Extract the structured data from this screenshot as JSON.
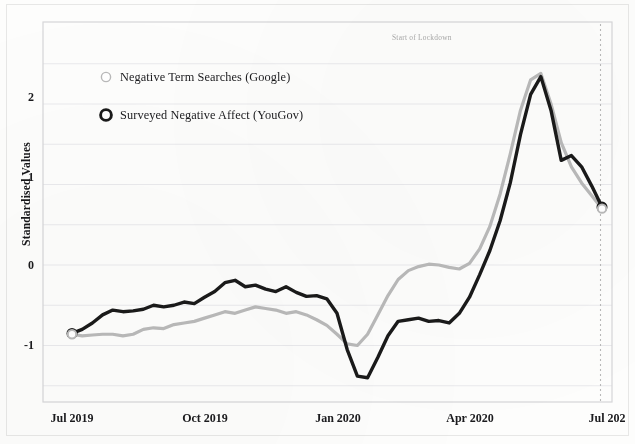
{
  "chart_data": {
    "type": "line",
    "title": "",
    "xlabel": "",
    "ylabel": "Standardised Values",
    "ylim": [
      -1.75,
      2.75
    ],
    "yticks": [
      2,
      1,
      0,
      -1
    ],
    "ytick_labels": [
      "2",
      "1",
      "0",
      "-1"
    ],
    "gridlines_y": [
      2.5,
      2,
      1.5,
      1,
      0.5,
      0,
      -0.5,
      -1,
      -1.5
    ],
    "grid": true,
    "xticks": [
      "Jul 2019",
      "Oct 2019",
      "Jan 2020",
      "Apr 2020",
      "Jul 202"
    ],
    "xtick_positions": [
      0,
      13,
      26,
      39,
      52
    ],
    "x_unit": "weeks from Jul 2019",
    "x_range": [
      0,
      52
    ],
    "legend_position": "upper-left inside plot",
    "annotations": [
      {
        "text": "Start of Lockdown",
        "x": 51.5,
        "type": "vertical-dashed-line",
        "line_x": 52.0,
        "color": "#b9b9b9"
      }
    ],
    "series": [
      {
        "name": "Negative Term Searches (Google)",
        "color": "#b9b9b9",
        "linewidth": 3.2,
        "marker": "open-circle",
        "marker_edge": "#b9b9b9",
        "x": [
          0,
          1,
          2,
          3,
          4,
          5,
          6,
          7,
          8,
          9,
          10,
          11,
          12,
          13,
          14,
          15,
          16,
          17,
          18,
          19,
          20,
          21,
          22,
          23,
          24,
          25,
          26,
          27,
          28,
          29,
          30,
          31,
          32,
          33,
          34,
          35,
          36,
          37,
          38,
          39,
          40,
          41,
          42,
          43,
          44,
          45,
          46,
          47,
          48,
          49,
          50,
          51,
          52
        ],
        "values": [
          -0.86,
          -0.88,
          -0.87,
          -0.86,
          -0.86,
          -0.88,
          -0.86,
          -0.8,
          -0.78,
          -0.79,
          -0.74,
          -0.72,
          -0.7,
          -0.66,
          -0.62,
          -0.58,
          -0.6,
          -0.56,
          -0.52,
          -0.54,
          -0.56,
          -0.6,
          -0.58,
          -0.62,
          -0.68,
          -0.75,
          -0.86,
          -0.98,
          -1.0,
          -0.86,
          -0.62,
          -0.38,
          -0.18,
          -0.07,
          -0.02,
          0.01,
          0.0,
          -0.03,
          -0.05,
          0.02,
          0.2,
          0.48,
          0.88,
          1.38,
          1.92,
          2.3,
          2.38,
          2.0,
          1.52,
          1.22,
          1.02,
          0.86,
          0.7
        ]
      },
      {
        "name": "Surveyed Negative Affect (YouGov)",
        "color": "#1a1a1a",
        "linewidth": 3.4,
        "marker": "open-circle",
        "marker_edge": "#1a1a1a",
        "x": [
          0,
          1,
          2,
          3,
          4,
          5,
          6,
          7,
          8,
          9,
          10,
          11,
          12,
          13,
          14,
          15,
          16,
          17,
          18,
          19,
          20,
          21,
          22,
          23,
          24,
          25,
          26,
          27,
          28,
          29,
          30,
          31,
          32,
          33,
          34,
          35,
          36,
          37,
          38,
          39,
          40,
          41,
          42,
          43,
          44,
          45,
          46,
          47,
          48,
          49,
          50,
          51,
          52
        ],
        "values": [
          -0.85,
          -0.8,
          -0.72,
          -0.62,
          -0.56,
          -0.58,
          -0.57,
          -0.55,
          -0.5,
          -0.52,
          -0.5,
          -0.46,
          -0.48,
          -0.4,
          -0.33,
          -0.22,
          -0.19,
          -0.27,
          -0.25,
          -0.3,
          -0.33,
          -0.27,
          -0.34,
          -0.39,
          -0.38,
          -0.42,
          -0.6,
          -1.05,
          -1.38,
          -1.4,
          -1.15,
          -0.88,
          -0.7,
          -0.68,
          -0.66,
          -0.7,
          -0.69,
          -0.72,
          -0.6,
          -0.4,
          -0.12,
          0.18,
          0.55,
          1.02,
          1.62,
          2.12,
          2.34,
          1.92,
          1.3,
          1.36,
          1.22,
          0.98,
          0.72
        ]
      }
    ],
    "start_markers": [
      {
        "series": "Surveyed Negative Affect (YouGov)",
        "x": 0,
        "y": -0.85
      },
      {
        "series": "Negative Term Searches (Google)",
        "x": 0,
        "y": -0.86
      }
    ],
    "end_markers": [
      {
        "series": "Surveyed Negative Affect (YouGov)",
        "x": 52,
        "y": 0.72
      },
      {
        "series": "Negative Term Searches (Google)",
        "x": 52,
        "y": 0.7
      }
    ]
  },
  "legend": {
    "items": [
      {
        "label": "Negative Term Searches (Google)",
        "marker": "open-circle-light",
        "color": "#b9b9b9"
      },
      {
        "label": "Surveyed Negative Affect (YouGov)",
        "marker": "open-circle-bold",
        "color": "#1a1a1a"
      }
    ]
  },
  "axes": {
    "y_title": "Standardised Values",
    "y_ticks": [
      "2",
      "1",
      "0",
      "-1"
    ],
    "x_ticks": [
      "Jul 2019",
      "Oct 2019",
      "Jan 2020",
      "Apr 2020",
      "Jul 202"
    ]
  },
  "annotation": {
    "lockdown": "Start of Lockdown"
  },
  "colors": {
    "google_series": "#b9b9b9",
    "yougov_series": "#1a1a1a",
    "grid": "#e9e9ec",
    "frame": "#d6d6d8",
    "lockdown_line": "#b9b9b9",
    "background": "#fdfdfc"
  }
}
